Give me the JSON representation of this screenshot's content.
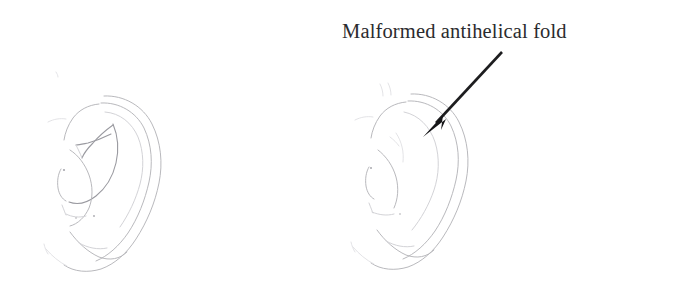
{
  "figure": {
    "background_color": "#ffffff",
    "width": 685,
    "height": 290
  },
  "annotation": {
    "label": "Malformed antihelical fold",
    "text_color": "#2b2b2e",
    "arrow_color": "#161618",
    "arrow_tail": "502,52",
    "arrow_tip": "423,137"
  },
  "panels": [
    {
      "id": "left-ear",
      "name": "normal-ear-drawing",
      "description": "Ear with well-defined antihelix and crura",
      "line_color": "#b9b9bd"
    },
    {
      "id": "right-ear",
      "name": "malformed-ear-drawing",
      "description": "Ear with absent antihelical fold",
      "line_color": "#b9b9bd"
    }
  ]
}
